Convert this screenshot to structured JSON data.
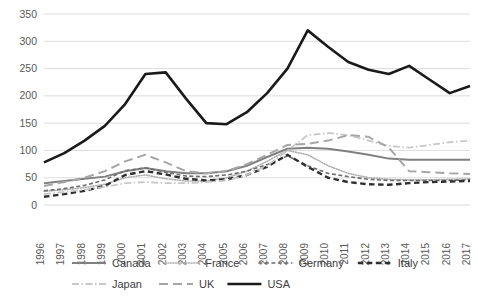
{
  "chart_data": {
    "type": "line",
    "title": "",
    "subtitle": "",
    "xlabel": "",
    "ylabel": "",
    "grid": true,
    "legend_position": "bottom",
    "xlim": [
      1996,
      2017
    ],
    "ylim": [
      0,
      350
    ],
    "ytick_step": 50,
    "yticks": [
      "0",
      "50",
      "100",
      "150",
      "200",
      "250",
      "300",
      "350"
    ],
    "categories": [
      "1996",
      "1997",
      "1998",
      "1999",
      "2000",
      "2001",
      "2002",
      "2003",
      "2004",
      "2005",
      "2006",
      "2007",
      "2008",
      "2009",
      "2010",
      "2011",
      "2012",
      "2013",
      "2014",
      "2015",
      "2016",
      "2017"
    ],
    "series": [
      {
        "name": "Canada",
        "style": "solid",
        "color": "#808080",
        "width": 2.0,
        "values": [
          40,
          44,
          48,
          52,
          62,
          68,
          62,
          58,
          58,
          62,
          72,
          88,
          103,
          105,
          103,
          98,
          92,
          85,
          83,
          83,
          83,
          83
        ]
      },
      {
        "name": "France",
        "style": "dotted",
        "color": "#b0b0b0",
        "width": 1.6,
        "values": [
          25,
          28,
          32,
          38,
          50,
          55,
          48,
          44,
          44,
          50,
          62,
          80,
          100,
          92,
          72,
          58,
          50,
          47,
          46,
          46,
          47,
          48
        ]
      },
      {
        "name": "Germany",
        "style": "dashed",
        "color": "#6e6e6e",
        "width": 1.6,
        "values": [
          26,
          30,
          36,
          46,
          63,
          68,
          60,
          53,
          52,
          55,
          62,
          74,
          90,
          72,
          58,
          52,
          47,
          45,
          45,
          45,
          45,
          46
        ]
      },
      {
        "name": "Italy",
        "style": "bold-dash",
        "color": "#2f2f2f",
        "width": 2.4,
        "values": [
          15,
          20,
          26,
          35,
          55,
          62,
          56,
          48,
          45,
          47,
          55,
          70,
          92,
          70,
          50,
          42,
          38,
          37,
          40,
          42,
          43,
          44
        ]
      },
      {
        "name": "Japan",
        "style": "dash-dot",
        "color": "#c8c8c8",
        "width": 1.8,
        "values": [
          20,
          24,
          28,
          33,
          40,
          42,
          40,
          40,
          42,
          45,
          55,
          72,
          100,
          128,
          132,
          128,
          118,
          108,
          105,
          110,
          115,
          118
        ]
      },
      {
        "name": "UK",
        "style": "long-dash",
        "color": "#a6a6a6",
        "width": 2.0,
        "values": [
          35,
          42,
          50,
          62,
          80,
          92,
          78,
          62,
          58,
          62,
          75,
          92,
          110,
          112,
          118,
          128,
          125,
          105,
          62,
          60,
          58,
          57
        ]
      },
      {
        "name": "USA",
        "style": "solid",
        "color": "#1a1a1a",
        "width": 2.6,
        "values": [
          78,
          95,
          118,
          145,
          185,
          240,
          243,
          195,
          150,
          148,
          170,
          205,
          250,
          320,
          290,
          262,
          248,
          240,
          255,
          230,
          205,
          218
        ]
      }
    ]
  },
  "legend": {
    "row1": [
      {
        "label": "Canada",
        "series": "Canada"
      },
      {
        "label": "France",
        "series": "France"
      },
      {
        "label": "Germany",
        "series": "Germany"
      },
      {
        "label": "Italy",
        "series": "Italy"
      }
    ],
    "row2": [
      {
        "label": "Japan",
        "series": "Japan"
      },
      {
        "label": "UK",
        "series": "UK"
      },
      {
        "label": "USA",
        "series": "USA"
      }
    ]
  }
}
